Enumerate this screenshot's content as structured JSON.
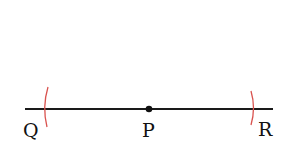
{
  "diagram": {
    "type": "geometric-construction",
    "line": {
      "x1": 25,
      "y1": 109,
      "x2": 273,
      "y2": 109,
      "color": "#1a1a1a"
    },
    "center_point": {
      "label": "P",
      "x": 149,
      "y": 109
    },
    "endpoints": [
      {
        "label": "Q",
        "x": 46
      },
      {
        "label": "R",
        "x": 253
      }
    ],
    "arc_color": "#d9534f",
    "labels": {
      "q": "Q",
      "p": "P",
      "r": "R"
    }
  }
}
